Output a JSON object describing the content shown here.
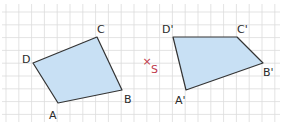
{
  "figure": {
    "grid": {
      "spacing": 12.8,
      "x0": 6,
      "y0": 12,
      "color": "#dcdcdc"
    },
    "fill_color": "#c8e0f4",
    "stroke_color": "#333333",
    "center": {
      "label": "S",
      "marker": "×",
      "x": 148,
      "y": 63,
      "color": "#c0394b"
    },
    "original": {
      "name": "ABCD",
      "vertices": [
        {
          "label": "A",
          "x": 58,
          "y": 103,
          "lx": 49,
          "ly": 119
        },
        {
          "label": "B",
          "x": 122,
          "y": 90,
          "lx": 124,
          "ly": 103
        },
        {
          "label": "C",
          "x": 97,
          "y": 37,
          "lx": 97,
          "ly": 33
        },
        {
          "label": "D",
          "x": 33,
          "y": 63,
          "lx": 22,
          "ly": 63
        }
      ]
    },
    "image": {
      "name": "A'B'C'D'",
      "vertices": [
        {
          "label": "A'",
          "x": 186,
          "y": 90,
          "lx": 175,
          "ly": 104
        },
        {
          "label": "B'",
          "x": 263,
          "y": 63,
          "lx": 263,
          "ly": 76
        },
        {
          "label": "C'",
          "x": 237,
          "y": 37,
          "lx": 237,
          "ly": 33
        },
        {
          "label": "D'",
          "x": 173,
          "y": 37,
          "lx": 162,
          "ly": 33
        }
      ]
    }
  }
}
